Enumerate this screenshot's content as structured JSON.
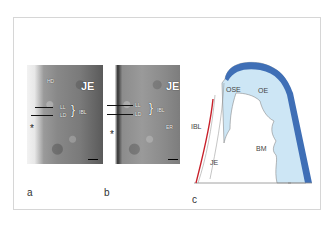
{
  "figure": {
    "panels": [
      {
        "id": "a",
        "letter": "a",
        "type": "micrograph",
        "labels": {
          "hd": "HD",
          "je": "JE",
          "ll": "LL",
          "ld": "LD",
          "ibl": "IBL",
          "asterisk": "*"
        }
      },
      {
        "id": "b",
        "letter": "b",
        "type": "micrograph",
        "labels": {
          "je": "JE",
          "ll": "LL",
          "ld": "LD",
          "ibl": "IBL",
          "er": "ER",
          "asterisk": "*"
        }
      },
      {
        "id": "c",
        "letter": "c",
        "type": "schematic",
        "labels": {
          "ibl": "IBL",
          "je": "JE",
          "ose": "OSE",
          "oe": "OE",
          "bm": "BM"
        },
        "colors": {
          "outer_band": "#3f6fb6",
          "fill": "#cde6f5",
          "ibl_line": "#c8202a",
          "outline": "#8a8a8a"
        }
      }
    ],
    "colors": {
      "frame_border": "#d6d6d6"
    }
  }
}
